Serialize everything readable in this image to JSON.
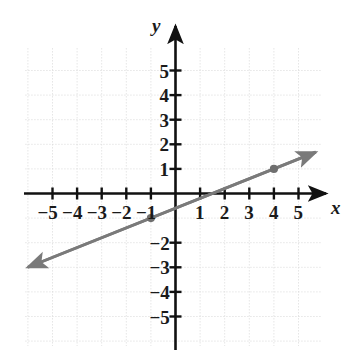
{
  "chart_data": {
    "type": "line",
    "title": "",
    "subtitle": "",
    "xlabel": "x",
    "ylabel": "y",
    "xlim": [
      -6.2,
      6.2
    ],
    "ylim": [
      -6.2,
      6.2
    ],
    "grid": true,
    "grid_style": "dotted",
    "legend": "none",
    "x_ticks": [
      -5,
      -4,
      -3,
      -2,
      -1,
      1,
      2,
      3,
      4,
      5
    ],
    "y_ticks": [
      5,
      4,
      3,
      2,
      1,
      -2,
      -3,
      -4,
      -5
    ],
    "x_tick_labels": [
      "−5",
      "−4",
      "−3",
      "−2",
      "−1",
      "1",
      "2",
      "3",
      "4",
      "5"
    ],
    "y_tick_labels": [
      "5",
      "4",
      "3",
      "2",
      "1",
      "−2",
      "−3",
      "−4",
      "−5"
    ],
    "series": [
      {
        "name": "line",
        "type": "line",
        "color": "#7a7a7a",
        "slope": 0.4,
        "intercept": -0.6,
        "equation": "y = (2/5)x − 3/5",
        "x_intercept": 1.5,
        "arrow_start": true,
        "arrow_end": true,
        "endpoints": [
          [
            -6.0,
            -3.0
          ],
          [
            5.7,
            1.68
          ]
        ],
        "marked_points": [
          {
            "x": -1,
            "y": -1,
            "label": ""
          },
          {
            "x": 4,
            "y": 1,
            "label": ""
          }
        ]
      }
    ],
    "colors": {
      "line": "#7a7a7a",
      "point": "#6f6f6f",
      "axis": "#111111",
      "grid": "#d8d8d8",
      "text": "#1a1a1a",
      "background": "#ffffff"
    }
  },
  "axes": {
    "x_axis_label": "x",
    "y_axis_label": "y"
  }
}
